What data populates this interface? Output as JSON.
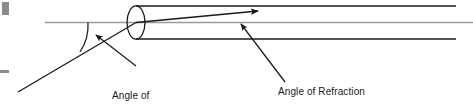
{
  "diagram": {
    "labels": {
      "incidence": "Angle of\nIncidence",
      "incidence_line1": "Angle of",
      "incidence_line2": "Incidence",
      "refraction": "Angle of Refraction"
    },
    "colors": {
      "stroke": "#1a1a1a",
      "axis": "#9a9a9a",
      "mark": "#8a8a8a",
      "background": "#ffffff",
      "text": "#1a1a1a"
    },
    "elements": {
      "cylinder_name": "cylindrical-medium",
      "incident_ray_name": "incident-ray",
      "refracted_ray_name": "refracted-ray",
      "normal_axis_name": "optical-axis-line",
      "angle_arc_name": "angle-of-incidence-arc",
      "corner_block_name": "corner-marker",
      "left_tick_name": "left-edge-tick"
    },
    "geometry": {
      "axis_y": 22,
      "cylinder_left_x": 136,
      "cylinder_right_x": 456,
      "cylinder_top_y": 6,
      "cylinder_bottom_y": 39,
      "ellipse_rx": 9,
      "ellipse_ry": 16.5,
      "entry_point_x": 136,
      "entry_point_y": 22,
      "incident_start_x": 18,
      "incident_start_y": 92,
      "refracted_end_x": 258,
      "refracted_end_y": 11
    }
  }
}
